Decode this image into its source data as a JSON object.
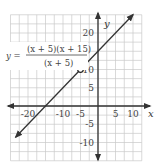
{
  "chart_data": {
    "type": "line",
    "title": "",
    "xlabel": "x",
    "ylabel": "y",
    "xlim": [
      -25,
      12.5
    ],
    "ylim": [
      -15,
      25
    ],
    "grid": true,
    "grid_step": 2.5,
    "x_ticks": [
      -20,
      -10,
      -5,
      5,
      10
    ],
    "x_tick_labels": [
      "-20",
      "-10",
      "-5",
      "5",
      "10"
    ],
    "y_ticks": [
      -10,
      -5,
      5,
      10,
      20
    ],
    "y_tick_labels": [
      "-10",
      "-5",
      "5",
      "10",
      "20"
    ],
    "series": [
      {
        "name": "y = (x+5)(x+15)/(x+5)",
        "equation": "y = x + 15",
        "x": [
          -23.5,
          10
        ],
        "y": [
          -8.5,
          25
        ],
        "arrows_both_ends": true
      }
    ],
    "open_points": [
      {
        "x": -5,
        "y": 10,
        "label": "hole"
      }
    ],
    "annotation": {
      "lhs": "y =",
      "numerator": "(x + 5)(x + 15)",
      "denominator": "(x + 5)",
      "position": "upper-left"
    }
  }
}
